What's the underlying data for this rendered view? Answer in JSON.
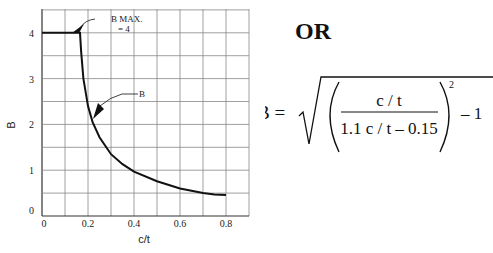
{
  "chart_data": {
    "type": "line",
    "title": "",
    "xlabel": "c/t",
    "ylabel": "B",
    "xlim": [
      0,
      0.8
    ],
    "ylim": [
      0,
      4.5
    ],
    "grid": true,
    "x_ticks": [
      "0",
      "0.2",
      "0.4",
      "0.6",
      "0.8"
    ],
    "y_ticks": [
      "0",
      "1",
      "2",
      "3",
      "4"
    ],
    "series": [
      {
        "name": "B",
        "x": [
          0.0,
          0.15,
          0.165,
          0.17,
          0.18,
          0.2,
          0.22,
          0.25,
          0.3,
          0.35,
          0.4,
          0.5,
          0.6,
          0.7,
          0.75,
          0.8
        ],
        "values": [
          4.0,
          4.0,
          4.0,
          3.6,
          3.0,
          2.4,
          2.05,
          1.72,
          1.35,
          1.13,
          0.97,
          0.76,
          0.6,
          0.5,
          0.47,
          0.46
        ]
      }
    ],
    "annotations": [
      {
        "text": "B MAX.",
        "sub": "= 4",
        "points_to": [
          0.13,
          4.0
        ]
      },
      {
        "text": "B",
        "points_to": [
          0.22,
          2.05
        ]
      }
    ]
  },
  "labels": {
    "or": "OR",
    "formula_lhs": "B =",
    "numerator": "c / t",
    "denominator": "1.1 c / t – 0.15",
    "exponent": "2",
    "minus_one": "– 1"
  }
}
